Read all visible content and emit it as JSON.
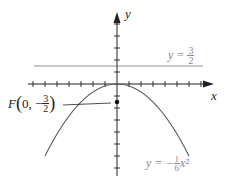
{
  "diagram": {
    "axes": {
      "x_label": "x",
      "y_label": "y",
      "tick_spacing_units": 1,
      "x_ticks": [
        -7,
        -6,
        -5,
        -4,
        -3,
        -2,
        -1,
        1,
        2,
        3,
        4,
        5,
        6,
        7
      ],
      "y_ticks": [
        5,
        4,
        3,
        2,
        1,
        -1,
        -2,
        -3,
        -4,
        -5,
        -6,
        -7
      ]
    },
    "parabola": {
      "label_prefix": "y = −",
      "label_num": "1",
      "label_den": "6",
      "label_suffix": "x²",
      "equation": "y = -1/6 x^2",
      "color": "#555555"
    },
    "directrix": {
      "label_prefix": "y = ",
      "label_num": "3",
      "label_den": "2",
      "equation": "y = 3/2",
      "color": "#777777"
    },
    "focus": {
      "label_prefix": "F",
      "label_coords_open": "(0, −",
      "label_num": "3",
      "label_den": "2",
      "label_close": ")",
      "x": 0,
      "y": -1.5
    }
  }
}
